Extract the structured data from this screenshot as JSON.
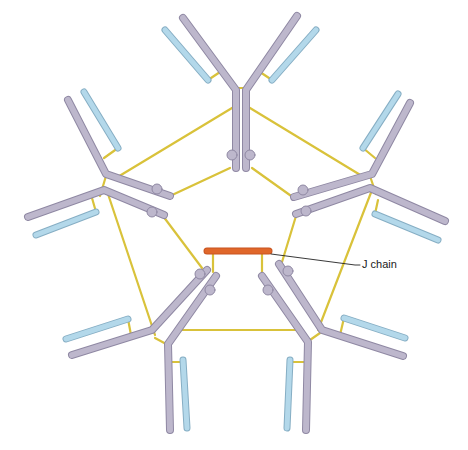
{
  "diagram": {
    "type": "IgM pentamer schematic",
    "colors": {
      "heavy_chain": "#bdb7cc",
      "heavy_chain_stroke": "#8f88a3",
      "light_chain": "#b3d8ea",
      "light_chain_stroke": "#86aec4",
      "disulfide_bond": "#d9c23a",
      "j_chain": "#e0672a",
      "leader_line": "#222222"
    },
    "labels": {
      "j_chain": "J chain"
    },
    "monomers": [
      {
        "name": "top"
      },
      {
        "name": "upper-left"
      },
      {
        "name": "upper-right"
      },
      {
        "name": "lower-left"
      },
      {
        "name": "lower-right"
      }
    ]
  }
}
